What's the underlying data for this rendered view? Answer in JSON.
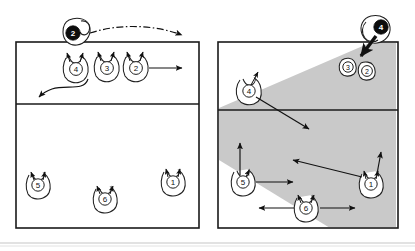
{
  "figure": {
    "type": "volleyball-tactics-diagram",
    "panel_count": 2,
    "background_color": "#ffffff",
    "line_color": "#1a1a1a",
    "shade_color": "#c9c9c9",
    "dark_marker_color": "#0d0d0d"
  },
  "left_panel": {
    "name": "left-court-diagram",
    "court": {
      "x": 16,
      "y": 42,
      "width": 183,
      "height": 186,
      "attack_line_y": 104
    },
    "attacker": {
      "label": "2",
      "style": "dark-disc",
      "x": 76,
      "y": 33,
      "description": "opposing attacker off-court above net"
    },
    "trajectory": {
      "name": "ball-trajectory",
      "style": "dash-dot-arc",
      "from_x": 88,
      "from_y": 33,
      "to_x": 188,
      "to_y": 39
    },
    "players": [
      {
        "label": "4",
        "x": 76,
        "y": 69,
        "arrows": [
          "up"
        ]
      },
      {
        "label": "3",
        "x": 107,
        "y": 68,
        "arrows": [
          "up"
        ]
      },
      {
        "label": "2",
        "x": 136,
        "y": 68,
        "arrows": [
          "up",
          "right"
        ]
      },
      {
        "label": "5",
        "x": 38,
        "y": 185,
        "arrows": [
          "up"
        ]
      },
      {
        "label": "6",
        "x": 105,
        "y": 199,
        "arrows": [
          "up"
        ]
      },
      {
        "label": "1",
        "x": 173,
        "y": 182,
        "arrows": [
          "up"
        ]
      }
    ],
    "movement_arrows": [
      {
        "name": "curve-arrow-from-4",
        "kind": "s-curve",
        "points": "88,78 78,92 52,88 40,97"
      },
      {
        "name": "straight-arrow-from-2",
        "kind": "straight",
        "x1": 148,
        "y1": 68,
        "x2": 184,
        "y2": 68
      }
    ]
  },
  "right_panel": {
    "name": "right-court-diagram",
    "court": {
      "x": 218,
      "y": 42,
      "width": 180,
      "height": 186,
      "attack_line_y": 110
    },
    "attacker": {
      "label": "4",
      "style": "dark-disc",
      "x": 381,
      "y": 27,
      "description": "attacker spiking from right antenna"
    },
    "spike_arrow": {
      "name": "spike-direction-arrow",
      "x1": 376,
      "y1": 36,
      "x2": 360,
      "y2": 57
    },
    "shaded_cone": {
      "name": "attack-coverage-cone",
      "color": "#c9c9c9",
      "apex_x": 372,
      "apex_y": 44,
      "description": "gray shaded attack angle zone spreading down-left across the court"
    },
    "players": [
      {
        "label": "3",
        "x": 348,
        "y": 67,
        "size": "small",
        "arrows": []
      },
      {
        "label": "2",
        "x": 367,
        "y": 71,
        "size": "small",
        "arrows": []
      },
      {
        "label": "4",
        "x": 249,
        "y": 91,
        "arrows": [
          "up-right"
        ]
      },
      {
        "label": "5",
        "x": 243,
        "y": 182,
        "arrows": [
          "up",
          "right"
        ]
      },
      {
        "label": "6",
        "x": 306,
        "y": 208,
        "arrows": [
          "up",
          "left",
          "right"
        ]
      },
      {
        "label": "1",
        "x": 371,
        "y": 184,
        "arrows": [
          "up",
          "up-left"
        ]
      }
    ],
    "movement_arrows": [
      {
        "name": "diagonal-arrow-from-4",
        "kind": "straight",
        "x1": 256,
        "y1": 96,
        "x2": 311,
        "y2": 130
      },
      {
        "name": "diagonal-arrow-to-center",
        "kind": "straight",
        "x1": 363,
        "y1": 178,
        "x2": 294,
        "y2": 161
      },
      {
        "name": "up-arrow-left-5",
        "kind": "straight",
        "x1": 240,
        "y1": 176,
        "x2": 240,
        "y2": 142
      },
      {
        "name": "right-arrow-from-5",
        "kind": "straight",
        "x1": 255,
        "y1": 182,
        "x2": 295,
        "y2": 182
      },
      {
        "name": "left-arrow-to-6",
        "kind": "straight",
        "x1": 292,
        "y1": 208,
        "x2": 258,
        "y2": 208
      },
      {
        "name": "right-arrow-from-6",
        "kind": "straight",
        "x1": 320,
        "y1": 208,
        "x2": 356,
        "y2": 208
      },
      {
        "name": "up-arrow-from-1",
        "kind": "straight",
        "x1": 375,
        "y1": 176,
        "x2": 379,
        "y2": 152
      }
    ]
  },
  "footer": {
    "name": "footer-divider",
    "visible": true
  }
}
